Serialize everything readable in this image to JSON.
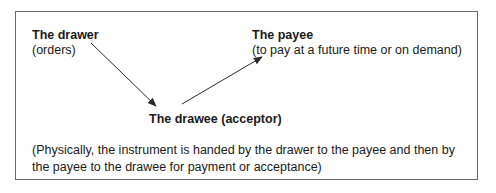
{
  "diagram": {
    "drawer": {
      "title": "The drawer",
      "subtitle": "(orders)"
    },
    "payee": {
      "title": "The payee",
      "subtitle": "(to pay at a future time or on demand)"
    },
    "drawee": {
      "title": "The drawee (acceptor)"
    },
    "note": "(Physically, the instrument is handed by the drawer to the payee and then by the payee to the drawee for payment or acceptance)",
    "edges": [
      {
        "from": "drawer",
        "to": "drawee"
      },
      {
        "from": "drawee",
        "to": "payee"
      }
    ],
    "colors": {
      "line": "#2a2a2a",
      "border": "#6a6a6a",
      "text": "#1a1a1a"
    }
  }
}
